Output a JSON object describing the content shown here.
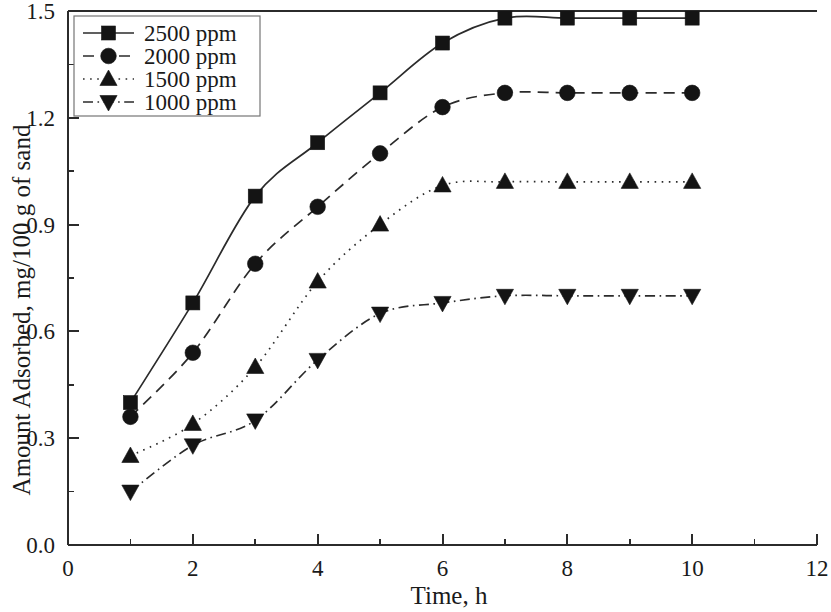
{
  "chart_data": {
    "type": "line",
    "title": "",
    "xlabel": "Time, h",
    "ylabel": "Amount Adsorbed, mg/100 g of sand",
    "xlim": [
      0,
      12
    ],
    "ylim": [
      0.0,
      1.5
    ],
    "x": [
      1,
      2,
      3,
      4,
      5,
      6,
      7,
      8,
      9,
      10
    ],
    "xticks": [
      0,
      2,
      4,
      6,
      8,
      10,
      12
    ],
    "xticklabels": [
      "0",
      "2",
      "4",
      "6",
      "8",
      "10",
      "12"
    ],
    "xminorticks": [
      1,
      3,
      5,
      7,
      9,
      11
    ],
    "yticks": [
      0.0,
      0.3,
      0.6,
      0.9,
      1.2,
      1.5
    ],
    "yticklabels": [
      "0.0",
      "0.3",
      "0.6",
      "0.9",
      "1.2",
      "1.5"
    ],
    "yminorticks": [
      0.15,
      0.45,
      0.75,
      1.05,
      1.35
    ],
    "grid": false,
    "legend_position": "top-left",
    "series": [
      {
        "name": "2500 ppm",
        "marker": "square",
        "linestyle": "solid",
        "color": "#141414",
        "values": [
          0.4,
          0.68,
          0.98,
          1.13,
          1.27,
          1.41,
          1.48,
          1.48,
          1.48,
          1.48
        ]
      },
      {
        "name": "2000 ppm",
        "marker": "circle",
        "linestyle": "dashed",
        "color": "#141414",
        "values": [
          0.36,
          0.54,
          0.79,
          0.95,
          1.1,
          1.23,
          1.27,
          1.27,
          1.27,
          1.27
        ]
      },
      {
        "name": "1500 ppm",
        "marker": "triangle-up",
        "linestyle": "dotted",
        "color": "#141414",
        "values": [
          0.25,
          0.34,
          0.5,
          0.74,
          0.9,
          1.01,
          1.02,
          1.02,
          1.02,
          1.02
        ]
      },
      {
        "name": "1000 ppm",
        "marker": "triangle-down",
        "linestyle": "dashdot",
        "color": "#141414",
        "values": [
          0.15,
          0.28,
          0.35,
          0.52,
          0.65,
          0.68,
          0.7,
          0.7,
          0.7,
          0.7
        ]
      }
    ]
  },
  "legend": {
    "entries": [
      "2500 ppm",
      "2000 ppm",
      "1500 ppm",
      "1000 ppm"
    ]
  },
  "axes": {
    "x_title": "Time, h",
    "y_title": "Amount Adsorbed, mg/100 g of sand"
  }
}
